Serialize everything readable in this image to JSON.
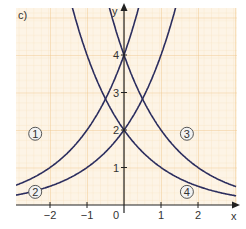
{
  "panel_label": "c)",
  "axes": {
    "x_label": "x",
    "y_label": "y"
  },
  "x_ticks": [
    {
      "value": -2,
      "label": "−2"
    },
    {
      "value": -1,
      "label": "−1"
    },
    {
      "value": 0,
      "label": "0"
    },
    {
      "value": 1,
      "label": "1"
    },
    {
      "value": 2,
      "label": "2"
    }
  ],
  "y_ticks": [
    {
      "value": 1,
      "label": "1"
    },
    {
      "value": 2,
      "label": "2"
    },
    {
      "value": 3,
      "label": "3"
    },
    {
      "value": 4,
      "label": "4"
    }
  ],
  "curve_labels": [
    {
      "id": "1",
      "text": "1",
      "x": -2.4,
      "y": 1.9
    },
    {
      "id": "2",
      "text": "2",
      "x": -2.4,
      "y": 0.35
    },
    {
      "id": "3",
      "text": "3",
      "x": 1.7,
      "y": 1.9
    },
    {
      "id": "4",
      "text": "4",
      "x": 1.7,
      "y": 0.35
    }
  ],
  "colors": {
    "curve": "#2b2d5e",
    "grid_major": "#f0c98a",
    "grid_minor": "#f8e3c2",
    "background": "#fdf3e3"
  },
  "chart_data": {
    "type": "line",
    "title": "c)",
    "xlabel": "x",
    "ylabel": "y",
    "xlim": [
      -2.9,
      3.0
    ],
    "ylim": [
      0,
      5.3
    ],
    "grid": true,
    "series": [
      {
        "name": "1",
        "formula": "4·2^x",
        "x": [
          -2.9,
          -2,
          -1,
          -0.5,
          0,
          0.3
        ],
        "values": [
          0.54,
          1,
          2,
          2.83,
          4,
          4.92
        ]
      },
      {
        "name": "2",
        "formula": "2·2^x",
        "x": [
          -2.9,
          -2,
          -1,
          -0.5,
          0,
          0.5,
          1.3
        ],
        "values": [
          0.27,
          0.5,
          1,
          1.41,
          2,
          2.83,
          4.92
        ]
      },
      {
        "name": "3",
        "formula": "4·2^-x",
        "x": [
          -0.3,
          0,
          0.5,
          1,
          2,
          3
        ],
        "values": [
          4.92,
          4,
          2.83,
          2,
          1,
          0.5
        ]
      },
      {
        "name": "4",
        "formula": "2·2^-x",
        "x": [
          -1.3,
          -0.5,
          0,
          1,
          2,
          3
        ],
        "values": [
          4.92,
          2.83,
          2,
          1,
          0.5,
          0.25
        ]
      }
    ]
  }
}
